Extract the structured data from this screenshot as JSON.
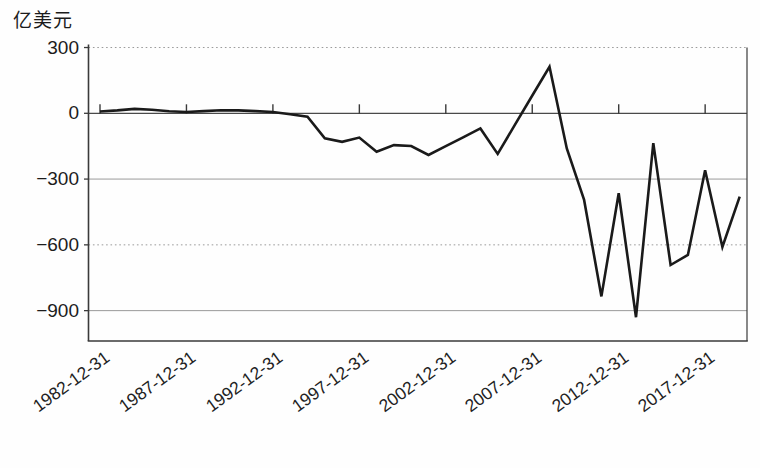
{
  "chart_data": {
    "type": "line",
    "title": "",
    "ylabel": "亿美元",
    "xlabel": "",
    "x": [
      1982,
      1983,
      1984,
      1985,
      1986,
      1987,
      1988,
      1989,
      1990,
      1991,
      1992,
      1993,
      1994,
      1995,
      1996,
      1997,
      1998,
      1999,
      2000,
      2001,
      2002,
      2003,
      2004,
      2005,
      2006,
      2007,
      2008,
      2009,
      2010,
      2011,
      2012,
      2013,
      2014,
      2015,
      2016,
      2017,
      2018,
      2019
    ],
    "series": [
      {
        "name": "series-1",
        "values": [
          8,
          13,
          20,
          16,
          9,
          6,
          10,
          14,
          13,
          10,
          6,
          -4,
          -15,
          -114,
          -130,
          -111,
          -175,
          -145,
          -149,
          -190,
          -150,
          -110,
          -69,
          -185,
          -52,
          81,
          212,
          -160,
          -395,
          -835,
          -365,
          -930,
          -136,
          -692,
          -646,
          -260,
          -610,
          -380
        ]
      }
    ],
    "yticks": [
      {
        "label": "300",
        "value": 300,
        "line": "dotted"
      },
      {
        "label": "0",
        "value": 0,
        "line": "solid-dark"
      },
      {
        "label": "−300",
        "value": -300,
        "line": "solid"
      },
      {
        "label": "−600",
        "value": -600,
        "line": "dotted"
      },
      {
        "label": "−900",
        "value": -900,
        "line": "solid"
      }
    ],
    "xticks": [
      {
        "label": "1982-12-31",
        "year": 1982
      },
      {
        "label": "1987-12-31",
        "year": 1987
      },
      {
        "label": "1992-12-31",
        "year": 1992
      },
      {
        "label": "1997-12-31",
        "year": 1997
      },
      {
        "label": "2002-12-31",
        "year": 2002
      },
      {
        "label": "2007-12-31",
        "year": 2007
      },
      {
        "label": "2012-12-31",
        "year": 2012
      },
      {
        "label": "2017-12-31",
        "year": 2017
      }
    ],
    "ylim": [
      -1035,
      300
    ],
    "xlim_years": [
      1982,
      2019
    ],
    "grid": "horizontal",
    "legend": "none",
    "colors": {
      "line": "#1a1a1a",
      "grid": "#9a9a9a",
      "zero_line": "#4a4a4a",
      "axis": "#3a3a3a"
    }
  }
}
